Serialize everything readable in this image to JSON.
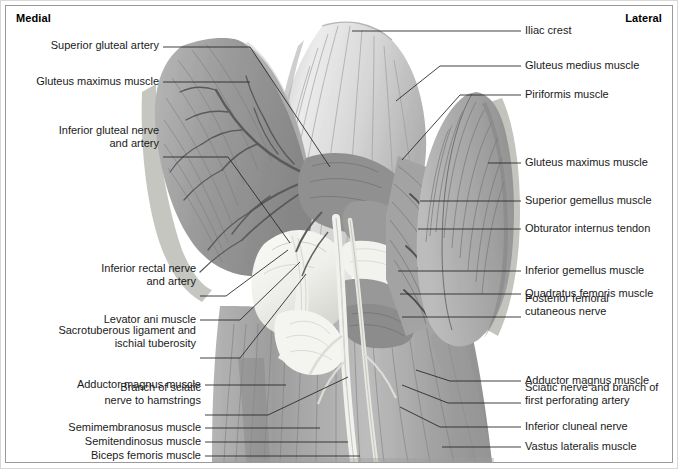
{
  "figure": {
    "orientation": {
      "medial": "Medial",
      "lateral": "Lateral"
    },
    "colors": {
      "frame": "#9a9a9a",
      "background": "#ffffff",
      "text": "#1a1a1a",
      "leader": "#2b2b2b",
      "muscle_dark": "#8d8d8d",
      "muscle_mid": "#a8a8a8",
      "muscle_light": "#c9c9c9",
      "bone_light": "#f2f2ef",
      "vessel": "#5d5d5d"
    }
  },
  "labels_left": [
    {
      "id": "superior-gluteal-artery",
      "lines": [
        "Superior gluteal artery"
      ],
      "text": "Superior gluteal artery",
      "text_right_x": 159,
      "text_baseline_y": 50,
      "leader": [
        [
          163,
          47
        ],
        [
          250,
          47
        ],
        [
          330,
          167
        ]
      ]
    },
    {
      "id": "gluteus-maximus-muscle-left",
      "lines": [
        "Gluteus maximus muscle"
      ],
      "text": "Gluteus maximus muscle",
      "text_right_x": 159,
      "text_baseline_y": 86,
      "leader": [
        [
          163,
          82
        ],
        [
          250,
          82
        ]
      ]
    },
    {
      "id": "inferior-gluteal-nerve-and-artery",
      "lines": [
        "Inferior gluteal nerve",
        "and artery"
      ],
      "text": "Inferior gluteal nerve\nand artery",
      "text_right_x": 159,
      "text_baseline_y": 148,
      "leader": [
        [
          163,
          157
        ],
        [
          228,
          157
        ],
        [
          290,
          243
        ]
      ]
    },
    {
      "id": "inferior-rectal-nerve-and-artery",
      "lines": [
        "Inferior rectal nerve",
        "and artery"
      ],
      "text": "Inferior rectal nerve\nand artery",
      "text_right_x": 196,
      "text_baseline_y": 286,
      "leader": [
        [
          200,
          296
        ],
        [
          226,
          296
        ],
        [
          288,
          250
        ]
      ]
    },
    {
      "id": "levator-ani-muscle",
      "lines": [
        "Levator ani muscle"
      ],
      "text": "Levator ani muscle",
      "text_right_x": 196,
      "text_baseline_y": 324,
      "leader": [
        [
          200,
          320
        ],
        [
          240,
          320
        ],
        [
          300,
          262
        ]
      ]
    },
    {
      "id": "sacrotuberous-ligament-and-ischial-tuberosity",
      "lines": [
        "Sacrotuberous ligament and",
        "ischial tuberosity"
      ],
      "text": "Sacrotuberous ligament and\nischial tuberosity",
      "text_right_x": 196,
      "text_baseline_y": 348,
      "leader": [
        [
          200,
          358
        ],
        [
          240,
          358
        ],
        [
          306,
          274
        ]
      ]
    },
    {
      "id": "adductor-magnus-muscle-left",
      "lines": [
        "Adductor magnus muscle"
      ],
      "text": "Adductor magnus muscle",
      "text_right_x": 201,
      "text_baseline_y": 389,
      "leader": [
        [
          205,
          385
        ],
        [
          286,
          385
        ]
      ]
    },
    {
      "id": "branch-of-sciatic-nerve-to-hamstrings",
      "lines": [
        "Branch of sciatic",
        "nerve to hamstrings"
      ],
      "text": "Branch of sciatic\nnerve to hamstrings",
      "text_right_x": 201,
      "text_baseline_y": 405,
      "leader": [
        [
          205,
          415
        ],
        [
          268,
          415
        ],
        [
          348,
          377
        ]
      ]
    },
    {
      "id": "semimembranosus-muscle",
      "lines": [
        "Semimembranosus muscle"
      ],
      "text": "Semimembranosus muscle",
      "text_right_x": 201,
      "text_baseline_y": 432,
      "leader": [
        [
          205,
          428
        ],
        [
          320,
          428
        ]
      ]
    },
    {
      "id": "semitendinosus-muscle",
      "lines": [
        "Semitendinosus muscle"
      ],
      "text": "Semitendinosus muscle",
      "text_right_x": 201,
      "text_baseline_y": 446,
      "leader": [
        [
          205,
          442
        ],
        [
          348,
          442
        ]
      ]
    },
    {
      "id": "biceps-femoris-muscle",
      "lines": [
        "Biceps femoris muscle"
      ],
      "text": "Biceps femoris muscle",
      "text_right_x": 201,
      "text_baseline_y": 460,
      "leader": [
        [
          205,
          456
        ],
        [
          360,
          456
        ]
      ]
    }
  ],
  "labels_right": [
    {
      "id": "iliac-crest",
      "lines": [
        "Iliac crest"
      ],
      "text": "Iliac crest",
      "text_left_x": 525,
      "text_baseline_y": 35,
      "leader": [
        [
          521,
          31
        ],
        [
          352,
          31
        ]
      ]
    },
    {
      "id": "gluteus-medius-muscle",
      "lines": [
        "Gluteus medius muscle"
      ],
      "text": "Gluteus medius muscle",
      "text_left_x": 525,
      "text_baseline_y": 70,
      "leader": [
        [
          521,
          66
        ],
        [
          440,
          66
        ],
        [
          396,
          101
        ]
      ]
    },
    {
      "id": "piriformis-muscle",
      "lines": [
        "Piriformis muscle"
      ],
      "text": "Piriformis muscle",
      "text_left_x": 525,
      "text_baseline_y": 99,
      "leader": [
        [
          521,
          95
        ],
        [
          460,
          95
        ],
        [
          402,
          160
        ]
      ]
    },
    {
      "id": "gluteus-maximus-muscle-right",
      "lines": [
        "Gluteus maximus muscle"
      ],
      "text": "Gluteus maximus muscle",
      "text_left_x": 525,
      "text_baseline_y": 167,
      "leader": [
        [
          521,
          163
        ],
        [
          488,
          163
        ]
      ]
    },
    {
      "id": "superior-gemellus-muscle",
      "lines": [
        "Superior gemellus muscle"
      ],
      "text": "Superior gemellus muscle",
      "text_left_x": 525,
      "text_baseline_y": 205,
      "leader": [
        [
          521,
          201
        ],
        [
          420,
          201
        ]
      ]
    },
    {
      "id": "obturator-internus-tendon",
      "lines": [
        "Obturator internus tendon"
      ],
      "text": "Obturator internus tendon",
      "text_left_x": 525,
      "text_baseline_y": 233,
      "leader": [
        [
          521,
          229
        ],
        [
          418,
          229
        ]
      ]
    },
    {
      "id": "inferior-gemellus-muscle",
      "lines": [
        "Inferior gemellus muscle"
      ],
      "text": "Inferior gemellus muscle",
      "text_left_x": 525,
      "text_baseline_y": 275,
      "leader": [
        [
          521,
          271
        ],
        [
          398,
          271
        ]
      ]
    },
    {
      "id": "quadratus-femoris-muscle",
      "lines": [
        "Quadratus femoris muscle"
      ],
      "text": "Quadratus femoris muscle",
      "text_left_x": 525,
      "text_baseline_y": 298,
      "leader": [
        [
          521,
          294
        ],
        [
          400,
          294
        ]
      ]
    },
    {
      "id": "posterior-femoral-cutaneous-nerve",
      "lines": [
        "Posterior femoral",
        "cutaneous nerve"
      ],
      "text": "Posterior femoral\ncutaneous nerve",
      "text_left_x": 525,
      "text_baseline_y": 316,
      "leader": [
        [
          521,
          317
        ],
        [
          402,
          317
        ]
      ]
    },
    {
      "id": "adductor-magnus-muscle-right",
      "lines": [
        "Adductor magnus muscle"
      ],
      "text": "Adductor magnus muscle",
      "text_left_x": 525,
      "text_baseline_y": 385,
      "leader": [
        [
          521,
          381
        ],
        [
          450,
          381
        ],
        [
          416,
          370
        ]
      ]
    },
    {
      "id": "sciatic-nerve-and-branch-of-first-perforating-artery",
      "lines": [
        "Sciatic nerve and branch of",
        "first perforating artery"
      ],
      "text": "Sciatic nerve and branch of\nfirst perforating artery",
      "text_left_x": 525,
      "text_baseline_y": 405,
      "leader": [
        [
          521,
          403
        ],
        [
          448,
          403
        ],
        [
          402,
          385
        ]
      ]
    },
    {
      "id": "inferior-cluneal-nerve",
      "lines": [
        "Inferior cluneal nerve"
      ],
      "text": "Inferior cluneal nerve",
      "text_left_x": 525,
      "text_baseline_y": 431,
      "leader": [
        [
          521,
          427
        ],
        [
          440,
          427
        ],
        [
          400,
          407
        ]
      ]
    },
    {
      "id": "vastus-lateralis-muscle",
      "lines": [
        "Vastus lateralis muscle"
      ],
      "text": "Vastus lateralis muscle",
      "text_left_x": 525,
      "text_baseline_y": 451,
      "leader": [
        [
          521,
          447
        ],
        [
          442,
          447
        ]
      ]
    }
  ],
  "illustration": {
    "description": "Posterior dissection of the gluteal region showing reflected gluteus maximus flaps on both sides, gluteus medius, the deep external rotators and the sciatic nerve descending into the posterior thigh.",
    "regions": [
      "left reflected gluteus maximus flap",
      "gluteus medius fan",
      "piriformis and gemelli",
      "sacrotuberous ligament and ischial tuberosity",
      "right reflected gluteus maximus flap",
      "posterior thigh hamstrings"
    ]
  }
}
